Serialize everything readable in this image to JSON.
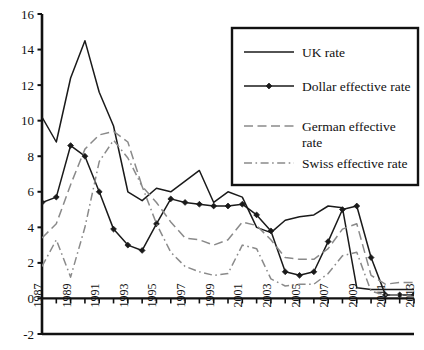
{
  "chart_data": {
    "type": "line",
    "title": "",
    "xlabel": "",
    "ylabel": "",
    "xlim": [
      1987,
      2013
    ],
    "ylim": [
      -2,
      16
    ],
    "ytick_step": 2,
    "yticks": [
      -2,
      0,
      2,
      4,
      6,
      8,
      10,
      12,
      14,
      16
    ],
    "ytick_labels": [
      "-2",
      "0",
      "2",
      "4",
      "6",
      "8",
      "10",
      "12",
      "14",
      "16"
    ],
    "x": [
      1987,
      1988,
      1989,
      1990,
      1991,
      1992,
      1993,
      1994,
      1995,
      1996,
      1997,
      1998,
      1999,
      2000,
      2001,
      2002,
      2003,
      2004,
      2005,
      2006,
      2007,
      2008,
      2009,
      2010,
      2011,
      2012,
      2013
    ],
    "xtick_labels": [
      "1987",
      "",
      "1989",
      "",
      "1991",
      "",
      "1993",
      "",
      "1995",
      "",
      "1997",
      "",
      "1999",
      "",
      "2001",
      "",
      "2003",
      "",
      "2005",
      "",
      "2007",
      "",
      "2009",
      "",
      "2011",
      "",
      "2013"
    ],
    "xticks_all": [
      1987,
      1988,
      1989,
      1990,
      1991,
      1992,
      1993,
      1994,
      1995,
      1996,
      1997,
      1998,
      1999,
      2000,
      2001,
      2002,
      2003,
      2004,
      2005,
      2006,
      2007,
      2008,
      2009,
      2010,
      2011,
      2012,
      2013
    ],
    "grid": false,
    "legend_position": "top-right",
    "series": [
      {
        "name": "UK rate",
        "style": "solid",
        "color": "#1a1a1a",
        "marker": "none",
        "values": [
          10.2,
          8.8,
          12.4,
          14.5,
          11.6,
          9.7,
          6.0,
          5.5,
          6.2,
          6.0,
          6.6,
          7.2,
          5.4,
          6.0,
          5.7,
          4.0,
          3.7,
          4.4,
          4.6,
          4.7,
          5.2,
          5.1,
          0.6,
          0.5,
          0.5,
          0.5,
          0.5
        ]
      },
      {
        "name": "Dollar effective rate",
        "style": "solid",
        "color": "#1a1a1a",
        "marker": "diamond",
        "values": [
          5.4,
          5.7,
          8.6,
          8.0,
          6.0,
          3.9,
          3.0,
          2.7,
          4.2,
          5.6,
          5.4,
          5.3,
          5.2,
          5.2,
          5.3,
          4.7,
          3.8,
          1.5,
          1.3,
          1.5,
          3.2,
          5.0,
          5.2,
          2.3,
          0.2,
          0.2,
          0.2
        ]
      },
      {
        "name": "German effective rate",
        "style": "dashed",
        "color": "#8a8a8a",
        "marker": "none",
        "values": [
          3.4,
          4.2,
          6.4,
          8.4,
          9.2,
          9.4,
          8.8,
          6.3,
          5.4,
          4.3,
          3.4,
          3.3,
          3.0,
          3.3,
          4.3,
          4.1,
          3.3,
          2.3,
          2.2,
          2.2,
          2.8,
          3.9,
          4.2,
          1.3,
          0.8,
          0.9,
          0.9
        ]
      },
      {
        "name": "Swiss effective rate",
        "style": "dashdot",
        "color": "#8a8a8a",
        "marker": "none",
        "values": [
          1.8,
          3.3,
          1.2,
          4.0,
          7.7,
          8.9,
          7.9,
          6.3,
          4.2,
          2.6,
          1.8,
          1.5,
          1.3,
          1.4,
          3.0,
          2.8,
          1.1,
          0.7,
          0.8,
          0.8,
          1.4,
          2.4,
          2.6,
          0.4,
          0.2,
          0.2,
          0.1
        ]
      }
    ],
    "legend": [
      {
        "label": "UK rate",
        "style": "solid",
        "color": "#1a1a1a",
        "marker": "none"
      },
      {
        "label": "Dollar effective rate",
        "style": "solid",
        "color": "#1a1a1a",
        "marker": "diamond"
      },
      {
        "label": "German effective",
        "label2": "rate",
        "style": "dashed",
        "color": "#8a8a8a",
        "marker": "none"
      },
      {
        "label": "Swiss effective rate",
        "style": "dashdot",
        "color": "#8a8a8a",
        "marker": "none"
      }
    ]
  }
}
